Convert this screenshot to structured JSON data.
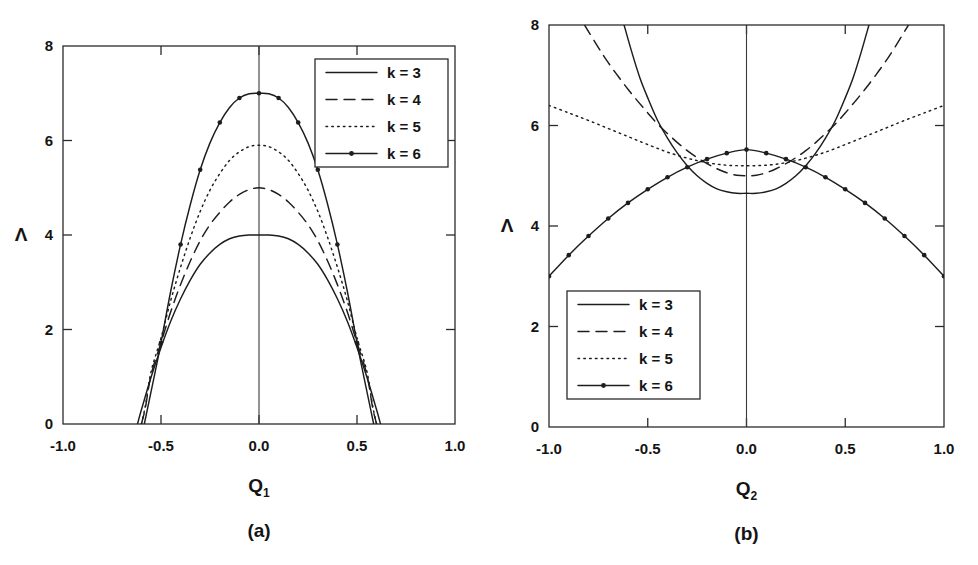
{
  "figure": {
    "panels": [
      {
        "id": "a",
        "caption": "(a)",
        "xlabel_base": "Q",
        "xlabel_sub": "1",
        "ylabel": "Λ",
        "legend_position": "top-right"
      },
      {
        "id": "b",
        "caption": "(b)",
        "xlabel_base": "Q",
        "xlabel_sub": "2",
        "ylabel": "Λ",
        "legend_position": "bottom-left"
      }
    ],
    "legend_entries": [
      {
        "label": "k = 3",
        "style": "solid"
      },
      {
        "label": "k = 4",
        "style": "dashed"
      },
      {
        "label": "k = 5",
        "style": "dotted"
      },
      {
        "label": "k = 6",
        "style": "solid-marker"
      }
    ],
    "xticks": [
      "-1.0",
      "-0.5",
      "0.0",
      "0.5",
      "1.0"
    ],
    "yticks": [
      "0",
      "2",
      "4",
      "6",
      "8"
    ],
    "colors": {
      "ink": "#1d1d1d",
      "frame": "#2b2b2b",
      "background": "#ffffff"
    }
  },
  "chart_data": [
    {
      "type": "line",
      "panel": "a",
      "title": "(a)",
      "xlabel": "Q1",
      "ylabel": "Λ",
      "xlim": [
        -1.0,
        1.0
      ],
      "ylim": [
        0,
        8
      ],
      "xticks": [
        -1.0,
        -0.5,
        0.0,
        0.5,
        1.0
      ],
      "yticks": [
        0,
        2,
        4,
        6,
        8
      ],
      "grid": false,
      "legend_position": "upper right",
      "series": [
        {
          "name": "k = 3",
          "style": "solid",
          "x": [
            -0.62,
            -0.6,
            -0.55,
            -0.5,
            -0.45,
            -0.4,
            -0.35,
            -0.3,
            -0.25,
            -0.2,
            -0.15,
            -0.1,
            -0.05,
            0.0,
            0.05,
            0.1,
            0.15,
            0.2,
            0.25,
            0.3,
            0.35,
            0.4,
            0.45,
            0.5,
            0.55,
            0.6,
            0.62
          ],
          "y": [
            0.0,
            0.3,
            1.0,
            1.62,
            2.18,
            2.65,
            3.05,
            3.38,
            3.62,
            3.8,
            3.92,
            3.98,
            4.0,
            4.0,
            4.0,
            3.98,
            3.92,
            3.8,
            3.62,
            3.38,
            3.05,
            2.65,
            2.18,
            1.62,
            1.0,
            0.3,
            0.0
          ]
        },
        {
          "name": "k = 4",
          "style": "dashed",
          "x": [
            -0.6,
            -0.58,
            -0.55,
            -0.5,
            -0.45,
            -0.4,
            -0.35,
            -0.3,
            -0.25,
            -0.2,
            -0.15,
            -0.1,
            -0.05,
            0.0,
            0.05,
            0.1,
            0.15,
            0.2,
            0.25,
            0.3,
            0.35,
            0.4,
            0.45,
            0.5,
            0.55,
            0.58,
            0.6
          ],
          "y": [
            0.0,
            0.34,
            1.05,
            1.72,
            2.38,
            2.95,
            3.45,
            3.88,
            4.22,
            4.48,
            4.7,
            4.86,
            4.96,
            5.0,
            4.96,
            4.86,
            4.7,
            4.48,
            4.22,
            3.88,
            3.45,
            2.95,
            2.38,
            1.72,
            1.05,
            0.34,
            0.0
          ]
        },
        {
          "name": "k = 5",
          "style": "dotted",
          "x": [
            -0.6,
            -0.58,
            -0.55,
            -0.5,
            -0.45,
            -0.4,
            -0.35,
            -0.3,
            -0.25,
            -0.2,
            -0.15,
            -0.1,
            -0.05,
            0.0,
            0.05,
            0.1,
            0.15,
            0.2,
            0.25,
            0.3,
            0.35,
            0.4,
            0.45,
            0.5,
            0.55,
            0.58,
            0.6
          ],
          "y": [
            0.0,
            0.38,
            1.12,
            1.82,
            2.62,
            3.32,
            3.95,
            4.5,
            4.95,
            5.3,
            5.58,
            5.76,
            5.87,
            5.9,
            5.87,
            5.76,
            5.58,
            5.3,
            4.95,
            4.5,
            3.95,
            3.32,
            2.62,
            1.82,
            1.12,
            0.38,
            0.0
          ]
        },
        {
          "name": "k = 6",
          "style": "solid-marker",
          "markers_x": [
            -0.5,
            -0.4,
            -0.3,
            -0.2,
            -0.1,
            0.0,
            0.1,
            0.2,
            0.3,
            0.4,
            0.5
          ],
          "x": [
            -0.585,
            -0.56,
            -0.52,
            -0.5,
            -0.45,
            -0.4,
            -0.35,
            -0.3,
            -0.25,
            -0.2,
            -0.15,
            -0.1,
            -0.05,
            0.0,
            0.05,
            0.1,
            0.15,
            0.2,
            0.25,
            0.3,
            0.35,
            0.4,
            0.45,
            0.5,
            0.52,
            0.56,
            0.585
          ],
          "y": [
            0.0,
            0.5,
            1.3,
            1.72,
            2.82,
            3.8,
            4.65,
            5.38,
            5.95,
            6.38,
            6.7,
            6.9,
            6.99,
            7.0,
            6.99,
            6.9,
            6.7,
            6.38,
            5.95,
            5.38,
            4.65,
            3.8,
            2.82,
            1.72,
            1.3,
            0.5,
            0.0
          ]
        }
      ]
    },
    {
      "type": "line",
      "panel": "b",
      "title": "(b)",
      "xlabel": "Q2",
      "ylabel": "Λ",
      "xlim": [
        -1.0,
        1.0
      ],
      "ylim": [
        0,
        8
      ],
      "xticks": [
        -1.0,
        -0.5,
        0.0,
        0.5,
        1.0
      ],
      "yticks": [
        0,
        2,
        4,
        6,
        8
      ],
      "grid": false,
      "legend_position": "lower left",
      "series": [
        {
          "name": "k = 3",
          "style": "solid",
          "x": [
            -0.62,
            -0.58,
            -0.54,
            -0.5,
            -0.45,
            -0.4,
            -0.35,
            -0.3,
            -0.25,
            -0.2,
            -0.15,
            -0.1,
            -0.05,
            0.0,
            0.05,
            0.1,
            0.15,
            0.2,
            0.25,
            0.3,
            0.35,
            0.4,
            0.45,
            0.5,
            0.54,
            0.58,
            0.62
          ],
          "y": [
            8.0,
            7.45,
            6.95,
            6.55,
            6.1,
            5.75,
            5.45,
            5.2,
            5.0,
            4.85,
            4.74,
            4.68,
            4.65,
            4.65,
            4.65,
            4.68,
            4.74,
            4.85,
            5.0,
            5.2,
            5.45,
            5.75,
            6.1,
            6.55,
            6.95,
            7.45,
            8.0
          ]
        },
        {
          "name": "k = 4",
          "style": "dashed",
          "x": [
            -0.82,
            -0.75,
            -0.7,
            -0.65,
            -0.6,
            -0.55,
            -0.5,
            -0.45,
            -0.4,
            -0.35,
            -0.3,
            -0.25,
            -0.2,
            -0.15,
            -0.1,
            -0.05,
            0.0,
            0.05,
            0.1,
            0.15,
            0.2,
            0.25,
            0.3,
            0.35,
            0.4,
            0.45,
            0.5,
            0.55,
            0.6,
            0.65,
            0.7,
            0.75,
            0.82
          ],
          "y": [
            8.0,
            7.55,
            7.25,
            6.98,
            6.72,
            6.48,
            6.25,
            6.03,
            5.84,
            5.66,
            5.5,
            5.36,
            5.24,
            5.14,
            5.06,
            5.01,
            5.0,
            5.01,
            5.06,
            5.14,
            5.24,
            5.36,
            5.5,
            5.66,
            5.84,
            6.03,
            6.25,
            6.48,
            6.72,
            6.98,
            7.25,
            7.55,
            8.0
          ]
        },
        {
          "name": "k = 5",
          "style": "dotted",
          "x": [
            -1.0,
            -0.9,
            -0.8,
            -0.7,
            -0.6,
            -0.5,
            -0.4,
            -0.3,
            -0.2,
            -0.1,
            0.0,
            0.1,
            0.2,
            0.3,
            0.4,
            0.5,
            0.6,
            0.7,
            0.8,
            0.9,
            1.0
          ],
          "y": [
            6.4,
            6.25,
            6.1,
            5.94,
            5.78,
            5.62,
            5.47,
            5.35,
            5.26,
            5.21,
            5.2,
            5.21,
            5.26,
            5.35,
            5.47,
            5.62,
            5.78,
            5.94,
            6.1,
            6.25,
            6.4
          ]
        },
        {
          "name": "k = 6",
          "style": "solid-marker",
          "markers_x": [
            -1.0,
            -0.9,
            -0.8,
            -0.7,
            -0.6,
            -0.5,
            -0.4,
            -0.3,
            -0.2,
            -0.1,
            0.0,
            0.1,
            0.2,
            0.3,
            0.4,
            0.5,
            0.6,
            0.7,
            0.8,
            0.9,
            1.0
          ],
          "x": [
            -1.0,
            -0.9,
            -0.8,
            -0.7,
            -0.6,
            -0.5,
            -0.4,
            -0.3,
            -0.2,
            -0.1,
            0.0,
            0.1,
            0.2,
            0.3,
            0.4,
            0.5,
            0.6,
            0.7,
            0.8,
            0.9,
            1.0
          ],
          "y": [
            3.0,
            3.42,
            3.8,
            4.15,
            4.46,
            4.73,
            4.97,
            5.17,
            5.33,
            5.45,
            5.52,
            5.45,
            5.33,
            5.17,
            4.97,
            4.73,
            4.46,
            4.15,
            3.8,
            3.42,
            3.0
          ]
        }
      ]
    }
  ]
}
